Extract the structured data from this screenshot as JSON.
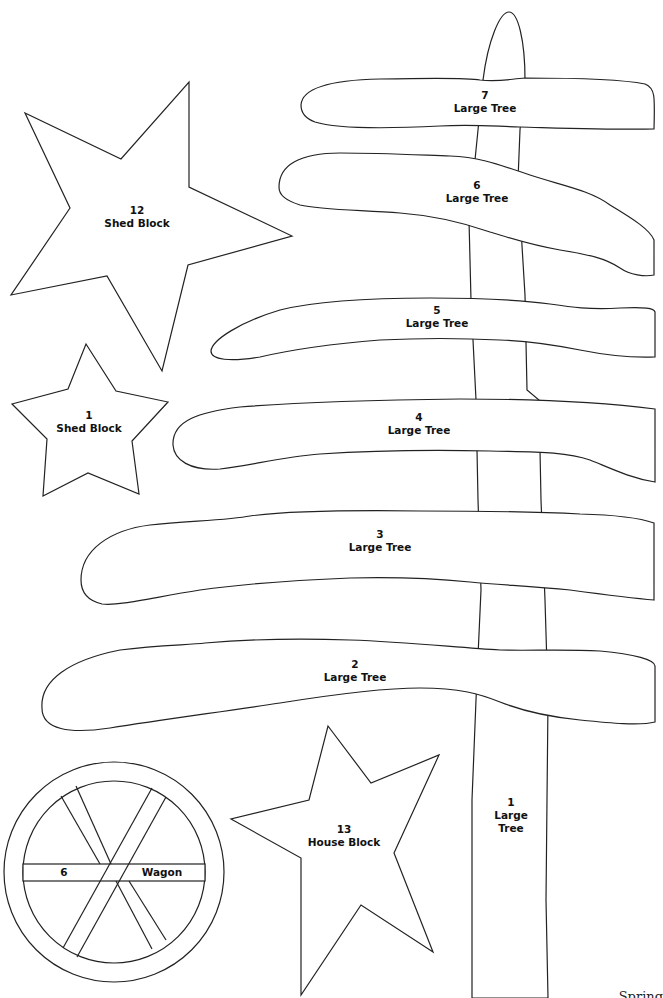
{
  "pattern": {
    "pieces": [
      {
        "id": "tree-7",
        "number": "7",
        "name": "Large Tree"
      },
      {
        "id": "tree-6",
        "number": "6",
        "name": "Large Tree"
      },
      {
        "id": "tree-5",
        "number": "5",
        "name": "Large Tree"
      },
      {
        "id": "tree-4",
        "number": "4",
        "name": "Large Tree"
      },
      {
        "id": "tree-3",
        "number": "3",
        "name": "Large Tree"
      },
      {
        "id": "tree-2",
        "number": "2",
        "name": "Large Tree"
      },
      {
        "id": "tree-1",
        "number": "1",
        "name_line1": "Large",
        "name_line2": "Tree"
      },
      {
        "id": "star-12",
        "number": "12",
        "name": "Shed Block"
      },
      {
        "id": "star-1",
        "number": "1",
        "name": "Shed Block"
      },
      {
        "id": "star-13",
        "number": "13",
        "name": "House Block"
      },
      {
        "id": "wagon-6",
        "number": "6",
        "name": "Wagon"
      }
    ],
    "corner_text": "Spring",
    "stroke_color": "#222222",
    "background_color": "#ffffff"
  }
}
